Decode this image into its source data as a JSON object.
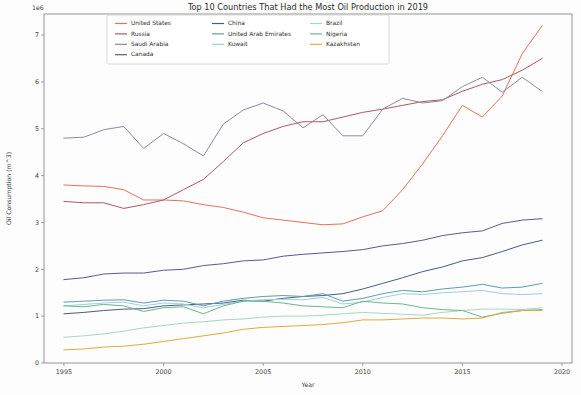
{
  "chart_data": {
    "type": "line",
    "title": "Top 10 Countries That Had the Most Oil Production in 2019",
    "xlabel": "Year",
    "ylabel": "Oil Consumption (m^3)",
    "y_offset_text": "1e6",
    "xlim": [
      1994,
      2020.5
    ],
    "ylim": [
      0,
      7.45
    ],
    "xticks": [
      1995,
      2000,
      2005,
      2010,
      2015,
      2020
    ],
    "xtick_labels": [
      "1995",
      "2000",
      "2005",
      "2010",
      "2015",
      "2020"
    ],
    "yticks": [
      0,
      1,
      2,
      3,
      4,
      5,
      6,
      7
    ],
    "ytick_labels": [
      "0",
      "1",
      "2",
      "3",
      "4",
      "5",
      "6",
      "7"
    ],
    "grid": false,
    "legend_position": "upper center",
    "legend_columns": 3,
    "x": [
      1995,
      1996,
      1997,
      1998,
      1999,
      2000,
      2001,
      2002,
      2003,
      2004,
      2005,
      2006,
      2007,
      2008,
      2009,
      2010,
      2011,
      2012,
      2013,
      2014,
      2015,
      2016,
      2017,
      2018,
      2019
    ],
    "series": [
      {
        "name": "United States",
        "color": "#e8705a",
        "values": [
          3.8,
          3.78,
          3.77,
          3.7,
          3.48,
          3.48,
          3.46,
          3.38,
          3.32,
          3.22,
          3.1,
          3.05,
          3.0,
          2.95,
          2.97,
          3.12,
          3.25,
          3.7,
          4.25,
          4.85,
          5.5,
          5.25,
          5.7,
          6.6,
          7.2
        ]
      },
      {
        "name": "Russia",
        "color": "#b05668",
        "values": [
          3.45,
          3.42,
          3.42,
          3.3,
          3.38,
          3.48,
          3.7,
          3.92,
          4.3,
          4.7,
          4.9,
          5.05,
          5.15,
          5.15,
          5.25,
          5.35,
          5.42,
          5.5,
          5.58,
          5.62,
          5.8,
          5.95,
          6.05,
          6.25,
          6.5
        ]
      },
      {
        "name": "Saudi Arabia",
        "color": "#8a8aa0",
        "values": [
          4.8,
          4.82,
          4.98,
          5.05,
          4.58,
          4.9,
          4.68,
          4.42,
          5.1,
          5.4,
          5.55,
          5.38,
          5.02,
          5.3,
          4.85,
          4.85,
          5.42,
          5.65,
          5.55,
          5.6,
          5.9,
          6.1,
          5.78,
          6.1,
          5.8
        ]
      },
      {
        "name": "Canada",
        "color": "#5a5a8f",
        "values": [
          1.78,
          1.82,
          1.9,
          1.92,
          1.92,
          1.98,
          2.0,
          2.08,
          2.12,
          2.18,
          2.2,
          2.28,
          2.32,
          2.35,
          2.38,
          2.42,
          2.5,
          2.55,
          2.62,
          2.72,
          2.78,
          2.82,
          2.98,
          3.05,
          3.08
        ]
      },
      {
        "name": "China",
        "color": "#4a5a8a",
        "values": [
          1.05,
          1.08,
          1.12,
          1.15,
          1.16,
          1.22,
          1.24,
          1.26,
          1.28,
          1.34,
          1.32,
          1.38,
          1.42,
          1.44,
          1.48,
          1.58,
          1.7,
          1.82,
          1.95,
          2.05,
          2.18,
          2.25,
          2.38,
          2.52,
          2.62
        ]
      },
      {
        "name": "United Arab Emirates",
        "color": "#5f9ea8",
        "values": [
          1.3,
          1.32,
          1.34,
          1.35,
          1.28,
          1.34,
          1.32,
          1.22,
          1.32,
          1.38,
          1.42,
          1.44,
          1.42,
          1.48,
          1.32,
          1.38,
          1.48,
          1.55,
          1.52,
          1.58,
          1.62,
          1.68,
          1.6,
          1.62,
          1.7
        ]
      },
      {
        "name": "Kuwait",
        "color": "#9ecfe0",
        "values": [
          1.22,
          1.25,
          1.28,
          1.3,
          1.22,
          1.28,
          1.26,
          1.18,
          1.25,
          1.32,
          1.35,
          1.36,
          1.35,
          1.4,
          1.26,
          1.3,
          1.4,
          1.48,
          1.46,
          1.5,
          1.52,
          1.55,
          1.48,
          1.46,
          1.48
        ]
      },
      {
        "name": "Brazil",
        "color": "#a8d8c0",
        "values": [
          0.55,
          0.58,
          0.62,
          0.68,
          0.75,
          0.8,
          0.85,
          0.88,
          0.92,
          0.94,
          0.98,
          1.0,
          1.0,
          1.02,
          1.05,
          1.08,
          1.06,
          1.04,
          1.02,
          1.08,
          1.12,
          1.15,
          1.15,
          1.14,
          1.18
        ]
      },
      {
        "name": "Nigeria",
        "color": "#6ab88a",
        "values": [
          1.22,
          1.2,
          1.25,
          1.22,
          1.1,
          1.18,
          1.2,
          1.05,
          1.22,
          1.32,
          1.32,
          1.28,
          1.22,
          1.2,
          1.18,
          1.32,
          1.28,
          1.26,
          1.18,
          1.14,
          1.12,
          0.98,
          1.06,
          1.12,
          1.14
        ]
      },
      {
        "name": "Kazakhstan",
        "color": "#e0a93c",
        "values": [
          0.28,
          0.3,
          0.34,
          0.36,
          0.4,
          0.46,
          0.52,
          0.58,
          0.64,
          0.72,
          0.76,
          0.78,
          0.8,
          0.82,
          0.86,
          0.92,
          0.92,
          0.94,
          0.96,
          0.96,
          0.94,
          0.96,
          1.08,
          1.12,
          1.12
        ]
      }
    ],
    "legend_layout": [
      [
        "United States",
        "China",
        "Brazil"
      ],
      [
        "Russia",
        "United Arab Emirates",
        "Nigeria"
      ],
      [
        "Saudi Arabia",
        "Kuwait",
        "Kazakhstan"
      ],
      [
        "Canada",
        "",
        ""
      ]
    ]
  }
}
